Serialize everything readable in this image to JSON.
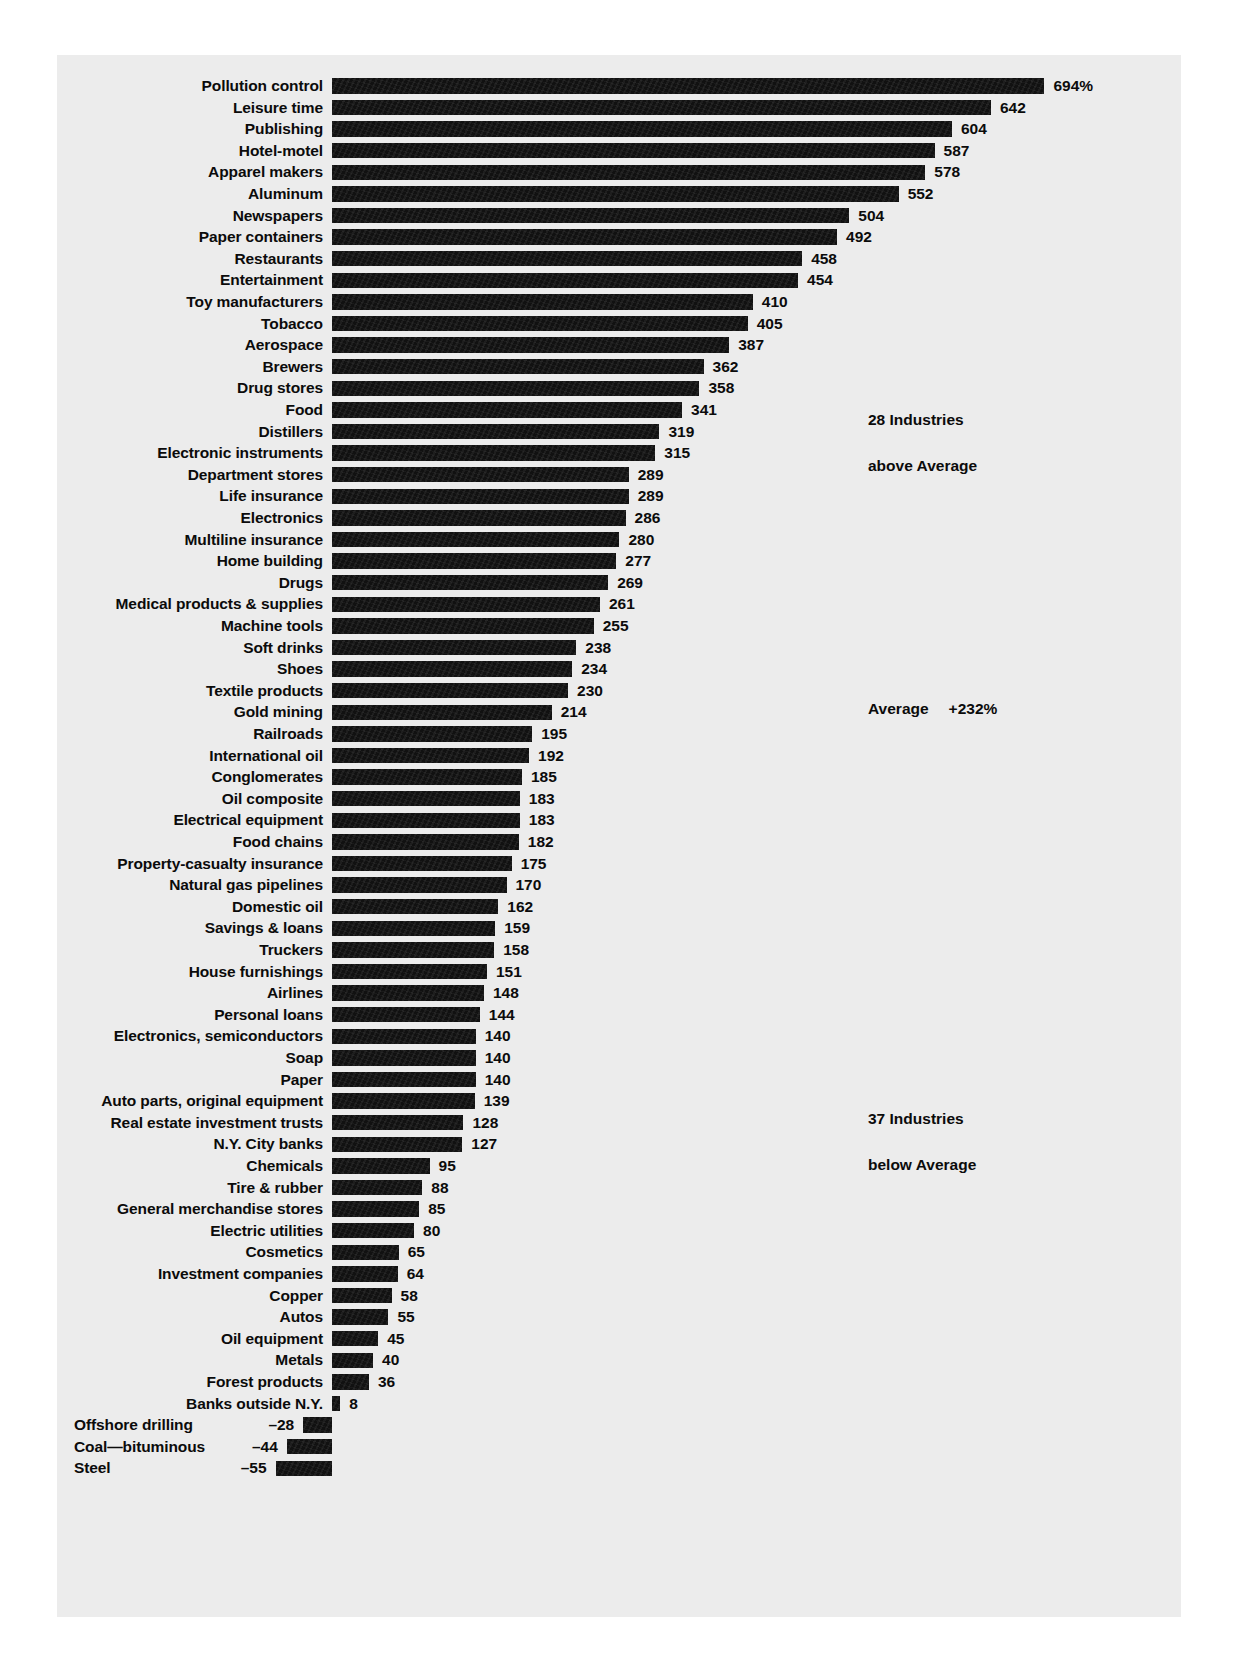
{
  "chart_data": {
    "type": "bar",
    "orientation": "horizontal",
    "title": "",
    "subtitle": "",
    "xlabel": "",
    "ylabel": "",
    "unit": "%",
    "value_suffix_first": "%",
    "grid": false,
    "axis_visible": false,
    "baseline_value": 0,
    "xlim": [
      -60,
      700
    ],
    "categories": [
      "Pollution control",
      "Leisure time",
      "Publishing",
      "Hotel-motel",
      "Apparel makers",
      "Aluminum",
      "Newspapers",
      "Paper containers",
      "Restaurants",
      "Entertainment",
      "Toy manufacturers",
      "Tobacco",
      "Aerospace",
      "Brewers",
      "Drug stores",
      "Food",
      "Distillers",
      "Electronic instruments",
      "Department stores",
      "Life insurance",
      "Electronics",
      "Multiline insurance",
      "Home building",
      "Drugs",
      "Medical products & supplies",
      "Machine tools",
      "Soft drinks",
      "Shoes",
      "Textile products",
      "Gold mining",
      "Railroads",
      "International oil",
      "Conglomerates",
      "Oil composite",
      "Electrical equipment",
      "Food chains",
      "Property-casualty insurance",
      "Natural gas pipelines",
      "Domestic oil",
      "Savings & loans",
      "Truckers",
      "House furnishings",
      "Airlines",
      "Personal loans",
      "Electronics, semiconductors",
      "Soap",
      "Paper",
      "Auto parts, original equipment",
      "Real estate investment trusts",
      "N.Y. City banks",
      "Chemicals",
      "Tire & rubber",
      "General merchandise stores",
      "Electric utilities",
      "Cosmetics",
      "Investment companies",
      "Copper",
      "Autos",
      "Oil equipment",
      "Metals",
      "Forest products",
      "Banks outside N.Y.",
      "Offshore drilling",
      "Coal—bituminous",
      "Steel"
    ],
    "values": [
      694,
      642,
      604,
      587,
      578,
      552,
      504,
      492,
      458,
      454,
      410,
      405,
      387,
      362,
      358,
      341,
      319,
      315,
      289,
      289,
      286,
      280,
      277,
      269,
      261,
      255,
      238,
      234,
      230,
      214,
      195,
      192,
      185,
      183,
      183,
      182,
      175,
      170,
      162,
      159,
      158,
      151,
      148,
      144,
      140,
      140,
      140,
      139,
      128,
      127,
      95,
      88,
      85,
      80,
      65,
      64,
      58,
      55,
      45,
      40,
      36,
      8,
      -28,
      -44,
      -55
    ],
    "value_labels": [
      "694%",
      "642",
      "604",
      "587",
      "578",
      "552",
      "504",
      "492",
      "458",
      "454",
      "410",
      "405",
      "387",
      "362",
      "358",
      "341",
      "319",
      "315",
      "289",
      "289",
      "286",
      "280",
      "277",
      "269",
      "261",
      "255",
      "238",
      "234",
      "230",
      "214",
      "195",
      "192",
      "185",
      "183",
      "183",
      "182",
      "175",
      "170",
      "162",
      "159",
      "158",
      "151",
      "148",
      "144",
      "140",
      "140",
      "140",
      "139",
      "128",
      "127",
      "95",
      "88",
      "85",
      "80",
      "65",
      "64",
      "58",
      "55",
      "45",
      "40",
      "36",
      "8",
      "–28",
      "–44",
      "–55"
    ],
    "bar_color": "#111111",
    "background_color": "#ececec",
    "page_color": "#ffffff",
    "text_color": "#0b0b0b"
  },
  "annotations": {
    "above_average": {
      "count_line": "28 Industries",
      "desc_line": "above Average"
    },
    "average": {
      "label": "Average",
      "value": "+232%"
    },
    "below_average": {
      "count_line": "37 Industries",
      "desc_line": "below Average"
    }
  }
}
